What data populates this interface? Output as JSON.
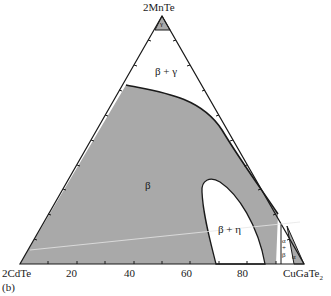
{
  "figure": {
    "panel_label": "(b)",
    "vertices": {
      "top": "2MnTe",
      "left": "2CdTe",
      "right_main": "CuGaTe",
      "right_sub": "2"
    },
    "axis_ticks": [
      "20",
      "40",
      "60",
      "80"
    ],
    "phase_labels": {
      "gamma": "γ",
      "beta_gamma": "β + γ",
      "beta": "β",
      "beta_eta": "β + η",
      "alpha_beta_a": "α",
      "alpha_beta_plus": "+",
      "alpha_beta_b": "β",
      "alpha": "α"
    },
    "colors": {
      "single_phase_fill": "#a9a9a9",
      "two_phase_fill": "#ffffff",
      "outline": "#1a1a1a"
    }
  }
}
